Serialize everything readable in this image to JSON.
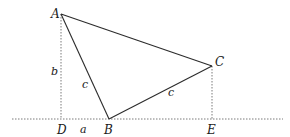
{
  "diagram": {
    "type": "geometry",
    "colors": {
      "line": "#2b2b2b",
      "dotted": "#7a7a7a",
      "text": "#1a1a1a",
      "background": "#ffffff"
    },
    "points": {
      "A": {
        "label": "A",
        "x": 61,
        "y": 14
      },
      "B": {
        "label": "B",
        "x": 109,
        "y": 119
      },
      "C": {
        "label": "C",
        "x": 212,
        "y": 66
      },
      "D": {
        "label": "D",
        "x": 61,
        "y": 119
      },
      "E": {
        "label": "E",
        "x": 212,
        "y": 119
      }
    },
    "segment_labels": {
      "AD": "b",
      "AB": "c",
      "BC": "c",
      "DB": "a"
    },
    "baseline": {
      "x1": 12,
      "x2": 283,
      "y": 119,
      "style": "dotted"
    }
  }
}
